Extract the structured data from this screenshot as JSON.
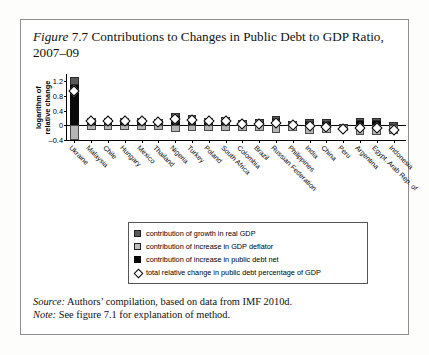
{
  "figure": {
    "label": "Figure",
    "number": "7.7",
    "title": "Contributions to Changes in Public Debt to GDP Ratio, 2007–09"
  },
  "source": {
    "prefix": "Source:",
    "text": "Authors’ compilation, based on data from IMF 2010d."
  },
  "note": {
    "prefix": "Note:",
    "text": "See figure 7.1 for explanation of method."
  },
  "legend": {
    "items": [
      {
        "swatch": "growth-swatch",
        "label": "contribution of growth in real GDP"
      },
      {
        "swatch": "deflator-swatch",
        "label": "contribution of increase in GDP deflator"
      },
      {
        "swatch": "debt-swatch",
        "label": "contribution of increase in public debt net"
      },
      {
        "swatch": "total-diamond-marker",
        "label": "total relative change in public debt percentage of GDP"
      }
    ]
  },
  "colors": {
    "growth": "#595959",
    "deflator": "#b5b5b5",
    "debt": "#0a0a0a",
    "marker_fill": "#ffffff",
    "marker_stroke": "#000000",
    "axis": "#000000",
    "frame": "#8e8e8e"
  },
  "chart_data": {
    "type": "bar",
    "subtype": "stacked-bar-with-marker",
    "title": "Figure 7.7 Contributions to Changes in Public Debt to GDP Ratio, 2007–09",
    "xlabel": "",
    "ylabel": "logarithm of relative change",
    "ylim": [
      -0.4,
      1.4
    ],
    "yticks": [
      1.2,
      0.8,
      0.4,
      0,
      -0.4
    ],
    "ytick_labels": [
      "1.2",
      "0.8",
      "0.4",
      "0",
      "–0.4"
    ],
    "grid": false,
    "legend_position": "below-plot",
    "categories": [
      "Ukraine",
      "Malaysia",
      "Chile",
      "Hungary",
      "Mexico",
      "Thailand",
      "Nigeria",
      "Turkey",
      "Poland",
      "South Africa",
      "Colombia",
      "Brazil",
      "Russian Federation",
      "Philippines",
      "India",
      "China",
      "Peru",
      "Argentina",
      "Egypt, Arab Rep. of",
      "Indonesia"
    ],
    "series": [
      {
        "name": "contribution of increase in public debt net",
        "key": "debt",
        "color": "#0a0a0a",
        "values": [
          1.16,
          0.19,
          0.17,
          0.16,
          0.18,
          0.14,
          0.3,
          0.26,
          0.19,
          0.22,
          0.12,
          0.15,
          0.22,
          0.1,
          0.15,
          0.15,
          0.01,
          0.19,
          0.19,
          0.06
        ]
      },
      {
        "name": "contribution of growth in real GDP",
        "key": "growth",
        "color": "#595959",
        "values": [
          0.15,
          0.02,
          0.02,
          0.03,
          0.03,
          0.02,
          0.03,
          0.03,
          0.02,
          0.02,
          0.02,
          0.02,
          0.03,
          0.02,
          0.02,
          0.02,
          0.02,
          0.02,
          0.02,
          0.02
        ]
      },
      {
        "name": "contribution of increase in GDP deflator",
        "key": "deflator",
        "color": "#b5b5b5",
        "values": [
          -0.35,
          -0.07,
          -0.06,
          -0.07,
          -0.08,
          -0.06,
          -0.12,
          -0.11,
          -0.09,
          -0.1,
          -0.09,
          -0.11,
          -0.16,
          -0.09,
          -0.17,
          -0.16,
          -0.1,
          -0.21,
          -0.22,
          -0.18
        ]
      }
    ],
    "marker_series": {
      "name": "total relative change in public debt percentage of GDP",
      "key": "total",
      "values": [
        0.94,
        0.13,
        0.12,
        0.11,
        0.12,
        0.09,
        0.16,
        0.14,
        0.11,
        0.12,
        0.04,
        0.05,
        0.07,
        0.01,
        -0.03,
        -0.04,
        -0.09,
        -0.06,
        -0.08,
        -0.12
      ]
    }
  }
}
